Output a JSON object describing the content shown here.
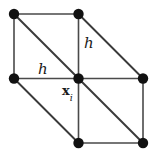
{
  "figure": {
    "type": "mesh-stencil-diagram",
    "width": 160,
    "height": 162,
    "background_color": "#ffffff",
    "edge_color": "#4a4a4a",
    "diagonal_color": "#3a3a3a",
    "node_color": "#111111",
    "node_radius": 5.2
  },
  "geometry": {
    "grid_columns": 2,
    "grid_rows": 2,
    "cell_size": 64.5,
    "x_coords": [
      14,
      78.5,
      143
    ],
    "y_coords": [
      14,
      78.5,
      143
    ]
  },
  "nodes": [
    {
      "id": "top-left",
      "name": "node-top-left",
      "x": 14,
      "y": 14,
      "visible": true
    },
    {
      "id": "top-mid",
      "name": "node-top-mid",
      "x": 78.5,
      "y": 14,
      "visible": true
    },
    {
      "id": "top-right",
      "name": "node-top-right",
      "x": 143,
      "y": 14,
      "visible": false
    },
    {
      "id": "mid-left",
      "name": "node-mid-left",
      "x": 14,
      "y": 78.5,
      "visible": true
    },
    {
      "id": "center",
      "name": "node-center-xi",
      "x": 78.5,
      "y": 78.5,
      "visible": true
    },
    {
      "id": "mid-right",
      "name": "node-mid-right",
      "x": 143,
      "y": 78.5,
      "visible": true
    },
    {
      "id": "bottom-left",
      "name": "node-bottom-left",
      "x": 14,
      "y": 143,
      "visible": false
    },
    {
      "id": "bottom-mid",
      "name": "node-bottom-mid",
      "x": 78.5,
      "y": 143,
      "visible": true
    },
    {
      "id": "bottom-right",
      "name": "node-bottom-right",
      "x": 143,
      "y": 143,
      "visible": true
    }
  ],
  "edges": [
    {
      "name": "edge-top-horizontal-left",
      "x1": 14,
      "y1": 14,
      "x2": 78.5,
      "y2": 14
    },
    {
      "name": "edge-left-vertical-upper",
      "x1": 14,
      "y1": 14,
      "x2": 14,
      "y2": 78.5
    },
    {
      "name": "edge-mid-horizontal-left",
      "x1": 14,
      "y1": 78.5,
      "x2": 78.5,
      "y2": 78.5
    },
    {
      "name": "edge-mid-vertical-upper",
      "x1": 78.5,
      "y1": 14,
      "x2": 78.5,
      "y2": 78.5
    },
    {
      "name": "edge-mid-horizontal-right",
      "x1": 78.5,
      "y1": 78.5,
      "x2": 143,
      "y2": 78.5
    },
    {
      "name": "edge-right-vertical-lower",
      "x1": 143,
      "y1": 78.5,
      "x2": 143,
      "y2": 143
    },
    {
      "name": "edge-mid-vertical-lower",
      "x1": 78.5,
      "y1": 78.5,
      "x2": 78.5,
      "y2": 143
    },
    {
      "name": "edge-bottom-horizontal-right",
      "x1": 78.5,
      "y1": 143,
      "x2": 143,
      "y2": 143
    }
  ],
  "diagonals": [
    {
      "name": "diagonal-top-left-cell",
      "x1": 14,
      "y1": 14,
      "x2": 78.5,
      "y2": 78.5
    },
    {
      "name": "diagonal-top-right-cell",
      "x1": 78.5,
      "y1": 14,
      "x2": 143,
      "y2": 78.5
    },
    {
      "name": "diagonal-bottom-left-cell",
      "x1": 14,
      "y1": 78.5,
      "x2": 78.5,
      "y2": 143
    },
    {
      "name": "diagonal-bottom-right-cell",
      "x1": 78.5,
      "y1": 78.5,
      "x2": 143,
      "y2": 143
    }
  ],
  "labels": {
    "spacing_vertical": {
      "text": "h",
      "x": 84,
      "y": 36
    },
    "spacing_horizontal": {
      "text": "h",
      "x": 38,
      "y": 62
    },
    "center_point": {
      "base": "x",
      "subscript": "i",
      "x": 62,
      "y": 84
    }
  }
}
